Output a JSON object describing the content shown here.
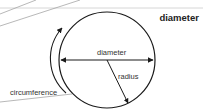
{
  "header": {
    "title": "diameter"
  },
  "diagram": {
    "labels": {
      "diameter": "diameter",
      "radius": "radius",
      "circumference": "circumference"
    },
    "colors": {
      "stroke": "#1a1a1a",
      "guide": "#bbbbbb",
      "text": "#333333"
    }
  }
}
